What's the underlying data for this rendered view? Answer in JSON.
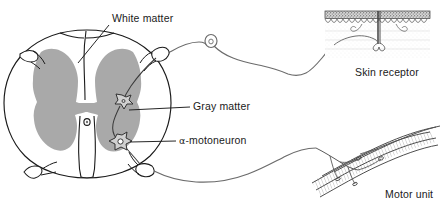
{
  "figure": {
    "labels": {
      "white_matter": "White matter",
      "gray_matter": "Gray matter",
      "motoneuron_symbol": "α-",
      "motoneuron_text": "motoneuron",
      "skin_receptor": "Skin receptor",
      "motor_unit": "Motor unit"
    },
    "colors": {
      "gray_matter_fill": "#a9a9a9",
      "outline": "#1a1a1a",
      "nerve_line": "#6b6b6b",
      "skin_epidermis": "#4a4a4a",
      "muscle_line": "#555555",
      "background": "#ffffff",
      "label_text": "#1a1a1a"
    },
    "structures": [
      "spinal cord cross-section",
      "butterfly-shaped gray matter",
      "central canal",
      "dorsal root with ganglion",
      "ventral root",
      "alpha-motoneuron cell bodies",
      "interneuron",
      "skin receptor with epidermis and dermis",
      "skeletal muscle fibers with motor end plates"
    ]
  }
}
